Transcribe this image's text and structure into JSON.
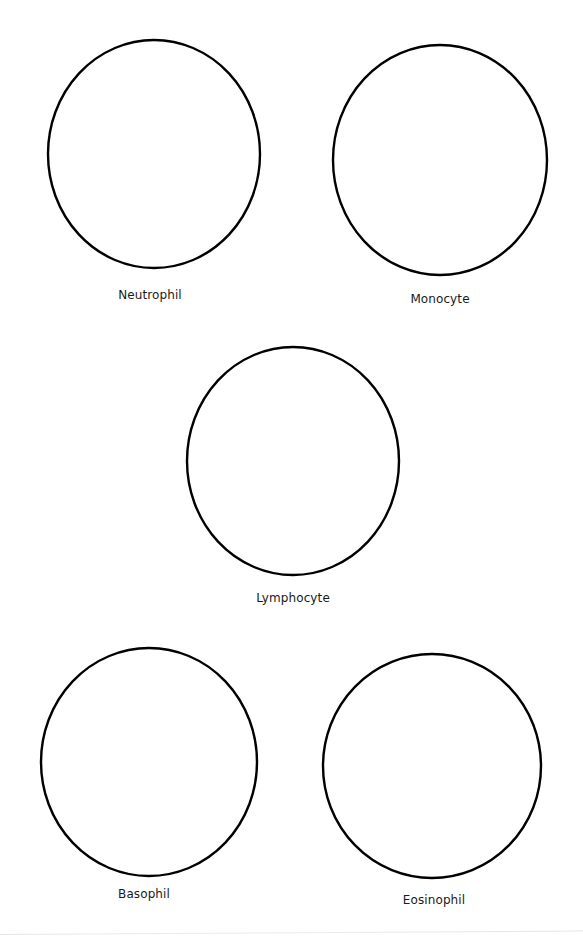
{
  "worksheet": {
    "stroke_color": "#000000",
    "background_color": "#ffffff",
    "cells": [
      {
        "id": "neutrophil",
        "label": "Neutrophil",
        "cx": 154,
        "cy": 154,
        "rx": 106,
        "ry": 114,
        "label_x": 150,
        "label_y": 288
      },
      {
        "id": "monocyte",
        "label": "Monocyte",
        "cx": 440,
        "cy": 160,
        "rx": 107,
        "ry": 115,
        "label_x": 440,
        "label_y": 292
      },
      {
        "id": "lymphocyte",
        "label": "Lymphocyte",
        "cx": 293,
        "cy": 461,
        "rx": 106,
        "ry": 114,
        "label_x": 293,
        "label_y": 591
      },
      {
        "id": "basophil",
        "label": "Basophil",
        "cx": 149,
        "cy": 762,
        "rx": 108,
        "ry": 114,
        "label_x": 144,
        "label_y": 887
      },
      {
        "id": "eosinophil",
        "label": "Eosinophil",
        "cx": 432,
        "cy": 766,
        "rx": 109,
        "ry": 112,
        "label_x": 434,
        "label_y": 893
      }
    ]
  }
}
